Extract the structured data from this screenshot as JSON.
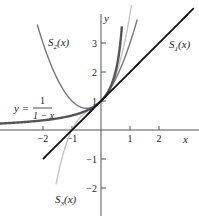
{
  "chart_data": {
    "type": "line",
    "title": "",
    "xlabel": "x",
    "ylabel": "y",
    "xlim": [
      -3.5,
      3.3
    ],
    "ylim": [
      -3.2,
      4.4
    ],
    "xticks": [
      -2,
      -1,
      1,
      2
    ],
    "yticks": [
      -2,
      -1,
      1,
      2,
      3
    ],
    "xtick_labels": [
      "−2",
      "−1",
      "1",
      "2"
    ],
    "ytick_labels": [
      "−2",
      "−1",
      "1",
      "2",
      "3"
    ],
    "grid": false,
    "series": [
      {
        "name": "y = 1/(1 − x)",
        "formula": "1/(1-x)",
        "color": "#555555",
        "width": 2.4,
        "domain": [
          -3.5,
          0.72
        ]
      },
      {
        "name": "S1(x)",
        "formula": "1 + x",
        "color": "#111111",
        "width": 1.8,
        "domain": [
          -2.0,
          3.2
        ]
      },
      {
        "name": "S2(x)",
        "formula": "1 + x + x^2",
        "color": "#777777",
        "width": 1.4,
        "domain": [
          -2.2,
          1.25
        ]
      },
      {
        "name": "S3(x)",
        "formula": "1 + x + x^2 + x^3",
        "color": "#c4c4c4",
        "width": 1.4,
        "domain": [
          -1.55,
          1.05
        ]
      }
    ],
    "annotations": [
      {
        "text": "S2(x)",
        "x": -1.85,
        "y": 3.0
      },
      {
        "text": "S1(x)",
        "x": 2.1,
        "y": 2.0
      },
      {
        "text": "S3(x)",
        "x": -1.3,
        "y": -3.0
      },
      {
        "text": "y = 1/(1 − x)",
        "x": -3.3,
        "y": 0.7
      }
    ]
  },
  "labels": {
    "x_axis": "x",
    "y_axis": "y",
    "s1": "S",
    "s1_sub": "1",
    "s2": "S",
    "s2_sub": "2",
    "s3": "S",
    "s3_sub": "3",
    "arg": "(x)",
    "yeq": "y =",
    "frac_num": "1",
    "frac_den": "1 − x"
  }
}
